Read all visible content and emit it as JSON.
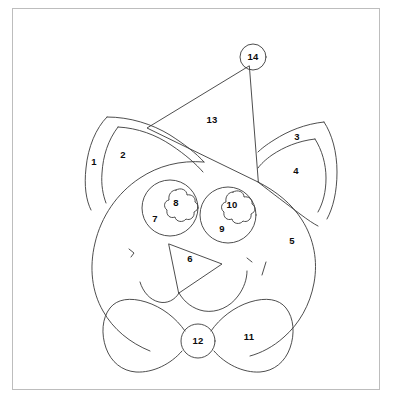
{
  "page": {
    "width": 398,
    "height": 412,
    "background_color": "#ffffff",
    "frame_color": "#bdbdbd",
    "line_color": "#3a3a3a",
    "label_color": "#0b0b0b"
  },
  "artwork": {
    "subject": "cat face with party hat and bow tie",
    "style": "color-by-number line drawing",
    "region_count": 14
  },
  "regions": [
    {
      "number": "1",
      "name": "left-ear-outer",
      "x": 94,
      "y": 162
    },
    {
      "number": "2",
      "name": "left-ear-inner",
      "x": 123,
      "y": 155
    },
    {
      "number": "3",
      "name": "right-ear-outer",
      "x": 297,
      "y": 137
    },
    {
      "number": "4",
      "name": "right-ear-inner",
      "x": 296,
      "y": 171
    },
    {
      "number": "5",
      "name": "face",
      "x": 292,
      "y": 241
    },
    {
      "number": "6",
      "name": "nose",
      "x": 190,
      "y": 259
    },
    {
      "number": "7",
      "name": "left-eye",
      "x": 155,
      "y": 219
    },
    {
      "number": "8",
      "name": "left-pupil",
      "x": 176,
      "y": 203
    },
    {
      "number": "9",
      "name": "right-eye",
      "x": 222,
      "y": 229
    },
    {
      "number": "10",
      "name": "right-pupil",
      "x": 232,
      "y": 205
    },
    {
      "number": "11",
      "name": "bow-tie-right",
      "x": 249,
      "y": 337
    },
    {
      "number": "12",
      "name": "bow-tie-knot",
      "x": 198,
      "y": 341
    },
    {
      "number": "13",
      "name": "party-hat",
      "x": 212,
      "y": 120
    },
    {
      "number": "14",
      "name": "hat-pompom",
      "x": 253,
      "y": 57
    }
  ]
}
